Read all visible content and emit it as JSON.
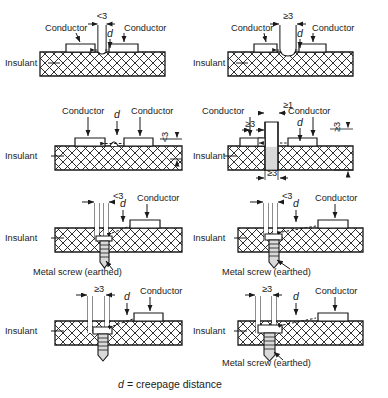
{
  "figure": {
    "title_caption_symbol": "d",
    "title_caption_text": "= creepage distance",
    "labels": {
      "conductor": "Conductor",
      "insulant": "Insulant",
      "metal_screw": "Metal screw (earthed)",
      "d": "d"
    },
    "dimension_values": {
      "lt3": "<3",
      "ge3": "≥3",
      "ge1": "≥1"
    }
  },
  "panels": [
    {
      "id": "r1c1",
      "row": 1,
      "col": 1,
      "variant": "narrow-groove",
      "description": "Groove narrower than 3 mm in insulant between two conductors",
      "conductor_left": "Conductor",
      "conductor_right": "Conductor",
      "insulant": "Insulant",
      "groove_width_label": "<3",
      "d_label": "d",
      "screw_label": null
    },
    {
      "id": "r1c2",
      "row": 1,
      "col": 2,
      "variant": "wide-groove",
      "description": "Groove 3 mm or wider in insulant between two conductors",
      "conductor_left": "Conductor",
      "conductor_right": "Conductor",
      "insulant": "Insulant",
      "groove_width_label": "≥3",
      "d_label": "d",
      "screw_label": null
    },
    {
      "id": "r2c1",
      "row": 2,
      "col": 1,
      "variant": "low-rib",
      "description": "Rib lower than 3 mm on insulant surface between two conductors",
      "conductor_left": "Conductor",
      "conductor_right": "Conductor",
      "insulant": "Insulant",
      "rib_height_label": "<3",
      "d_label": "d",
      "screw_label": null
    },
    {
      "id": "r2c2",
      "row": 2,
      "col": 2,
      "variant": "tall-rib",
      "description": "Rib 3 mm or higher, cemented joint widths at least 1 mm and 3 mm",
      "conductor_left": "Conductor",
      "conductor_right": "Conductor",
      "insulant": "Insulant",
      "rib_height_label": "≥3",
      "gap_top_label": "≥1",
      "gap_upper_label": "≥3",
      "gap_bottom_label": "≥3",
      "d_label": "d",
      "screw_label": null
    },
    {
      "id": "r3c1",
      "row": 3,
      "col": 1,
      "variant": "screw-narrow-gap",
      "description": "Uncemented narrow groove with earthed metal screw, gap less than 3 mm",
      "conductor_right": "Conductor",
      "insulant": "Insulant",
      "gap_width_label": "<3",
      "d_label": "d",
      "screw_label": "Metal screw (earthed)"
    },
    {
      "id": "r3c2",
      "row": 3,
      "col": 2,
      "variant": "screw-narrow-gap",
      "description": "Uncemented narrow groove with earthed metal screw, gap less than 3 mm",
      "conductor_right": "Conductor",
      "insulant": "Insulant",
      "gap_width_label": "<3",
      "d_label": "d",
      "screw_label": "Metal screw (earthed)"
    },
    {
      "id": "r4c1",
      "row": 4,
      "col": 1,
      "variant": "screw-wide-gap",
      "description": "Groove 3 mm or wider with earthed metal screw",
      "conductor_right": "Conductor",
      "insulant": "Insulant",
      "gap_width_label": "≥3",
      "d_label": "d",
      "screw_label": null
    },
    {
      "id": "r4c2",
      "row": 4,
      "col": 2,
      "variant": "screw-wide-gap",
      "description": "Groove 3 mm or wider with earthed metal screw",
      "conductor_right": "Conductor",
      "insulant": "Insulant",
      "gap_width_label": "≥3",
      "d_label": "d",
      "screw_label": "Metal screw (earthed)"
    }
  ],
  "colors": {
    "line": "#1a1a1a",
    "background": "#ffffff",
    "hatch": "#1a1a1a",
    "shading": "#d9d9d9"
  }
}
